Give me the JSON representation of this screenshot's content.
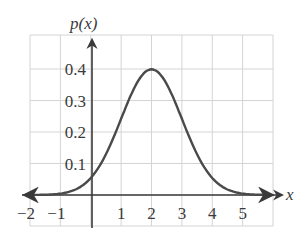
{
  "chart_data": {
    "type": "line",
    "title": "",
    "xlabel": "x",
    "ylabel": "p(x)",
    "xlim": [
      -2,
      6
    ],
    "ylim": [
      0,
      0.5
    ],
    "grid": true,
    "legend": null,
    "x_ticks": [
      -2,
      -1,
      1,
      2,
      3,
      4,
      5
    ],
    "x_tick_labels": [
      "−2",
      "−1",
      "1",
      "2",
      "3",
      "4",
      "5"
    ],
    "y_ticks": [
      0.1,
      0.2,
      0.3,
      0.4
    ],
    "y_tick_labels": [
      "0.1",
      "0.2",
      "0.3",
      "0.4"
    ],
    "series": [
      {
        "name": "p(x) normal density, mean 2, sd 1",
        "mean": 2,
        "sd": 1,
        "x": [
          -2,
          -1.5,
          -1,
          -0.5,
          0,
          0.5,
          1,
          1.5,
          2,
          2.5,
          3,
          3.5,
          4,
          4.5,
          5,
          5.5,
          6
        ],
        "values": [
          0.0001,
          0.0009,
          0.0044,
          0.0175,
          0.054,
          0.1295,
          0.242,
          0.3521,
          0.3989,
          0.3521,
          0.242,
          0.1295,
          0.054,
          0.0175,
          0.0044,
          0.0009,
          0.0001
        ]
      }
    ],
    "annotations": [
      "arrowheads on both ends of the curve",
      "arrowheads on x-axis (right) and y-axis (top)"
    ]
  },
  "style": {
    "grid_color": "#d4d4d4",
    "axis_color": "#3a3a3a",
    "curve_color": "#4a4a4a"
  }
}
